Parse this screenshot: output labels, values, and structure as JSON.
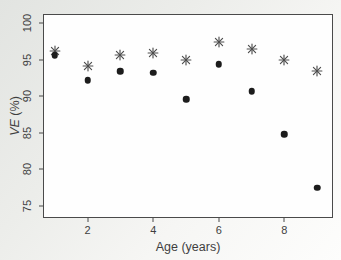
{
  "figure": {
    "x_axis_title": "Age (years)",
    "y_axis_title_em": "VE",
    "y_axis_title_rest": " (%)"
  },
  "chart_data": {
    "type": "scatter",
    "title": "",
    "xlabel": "Age (years)",
    "ylabel": "VE (%)",
    "x": [
      1,
      2,
      3,
      4,
      5,
      6,
      7,
      8,
      9
    ],
    "series": [
      {
        "name": "star markers (*)",
        "marker": "asterisk",
        "color": "#4d4d4d",
        "values": [
          96.2,
          94.1,
          95.6,
          95.9,
          94.9,
          97.4,
          96.4,
          95.0,
          93.5
        ]
      },
      {
        "name": "filled circle markers",
        "marker": "circle",
        "color": "#1c1c1c",
        "values": [
          95.6,
          92.2,
          93.4,
          93.2,
          89.6,
          94.4,
          90.7,
          84.8,
          77.5
        ]
      }
    ],
    "xlim": [
      0.67,
      9.45
    ],
    "ylim": [
      73.5,
      101.1
    ],
    "x_ticks": [
      2,
      4,
      6,
      8
    ],
    "y_ticks": [
      75,
      80,
      85,
      90,
      95,
      100
    ],
    "grid": false,
    "legend": "none",
    "frame": "box"
  }
}
